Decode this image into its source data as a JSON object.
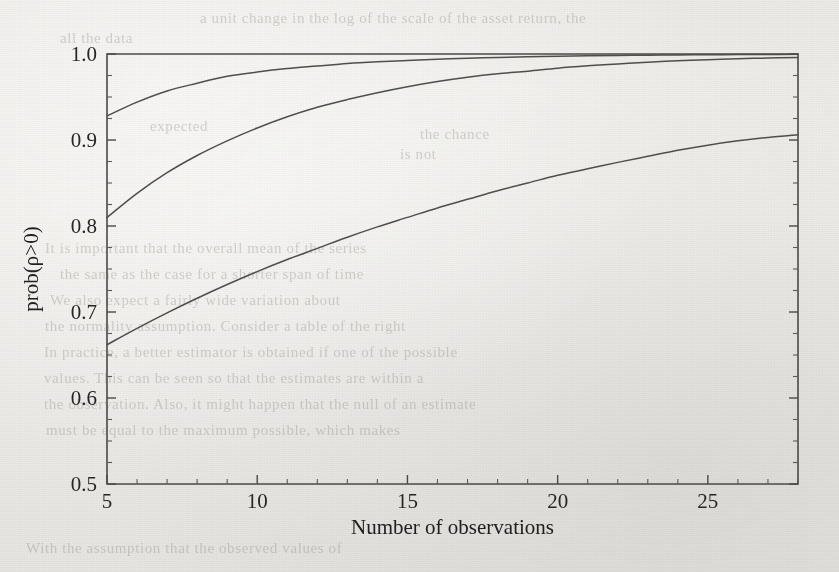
{
  "figure": {
    "background_color": "#efefec",
    "ink_color": "#4e4e4b"
  },
  "bleed_text": [
    {
      "text": "a unit change in the log of the scale of the asset return, the",
      "x": 200,
      "y": 10
    },
    {
      "text": "all the data",
      "x": 60,
      "y": 30
    },
    {
      "text": "expected",
      "x": 150,
      "y": 118
    },
    {
      "text": "the chance",
      "x": 420,
      "y": 126
    },
    {
      "text": "is not",
      "x": 400,
      "y": 146
    },
    {
      "text": "It is important that the overall mean of the series",
      "x": 45,
      "y": 240
    },
    {
      "text": "the same as the case for a shorter span of time",
      "x": 60,
      "y": 266
    },
    {
      "text": "We also expect a fairly wide variation about",
      "x": 50,
      "y": 292
    },
    {
      "text": "the normality assumption. Consider a table of the right",
      "x": 45,
      "y": 318
    },
    {
      "text": "In practice, a better estimator is obtained if one of the possible",
      "x": 44,
      "y": 344
    },
    {
      "text": "values. This can be seen so that the estimates are within a",
      "x": 44,
      "y": 370
    },
    {
      "text": "the observation. Also, it might happen that the null of an estimate",
      "x": 44,
      "y": 396
    },
    {
      "text": "must be equal to the maximum possible, which makes",
      "x": 46,
      "y": 422
    },
    {
      "text": "With the assumption that the observed values of",
      "x": 26,
      "y": 540
    }
  ],
  "chart_data": {
    "type": "line",
    "title": "",
    "xlabel": "Number of observations",
    "ylabel": "prob(ρ>0)",
    "xlim": [
      5,
      28
    ],
    "ylim": [
      0.5,
      1.0
    ],
    "xticks": [
      5,
      10,
      15,
      20,
      25
    ],
    "xticklabels": [
      "5",
      "10",
      "15",
      "20",
      "25"
    ],
    "yticks": [
      0.5,
      0.6,
      0.7,
      0.8,
      0.9,
      1.0
    ],
    "yticklabels": [
      "0.5",
      "0.6",
      "0.7",
      "0.8",
      "0.9",
      "1.0"
    ],
    "y_minor_step": 0.025,
    "x_minor_step": 1,
    "grid": false,
    "legend": "none",
    "series": [
      {
        "name": "upper-curve",
        "x": [
          5,
          6,
          7,
          8,
          9,
          10,
          11,
          12,
          13,
          14,
          15,
          16,
          17,
          18,
          19,
          20,
          21,
          22,
          23,
          24,
          25,
          26,
          27,
          28
        ],
        "y": [
          0.928,
          0.944,
          0.957,
          0.966,
          0.974,
          0.979,
          0.983,
          0.986,
          0.989,
          0.991,
          0.9925,
          0.994,
          0.9952,
          0.996,
          0.9968,
          0.9974,
          0.9979,
          0.9983,
          0.9986,
          0.9989,
          0.9991,
          0.9993,
          0.9995,
          0.9996
        ]
      },
      {
        "name": "middle-curve",
        "x": [
          5,
          6,
          7,
          8,
          9,
          10,
          11,
          12,
          13,
          14,
          15,
          16,
          17,
          18,
          19,
          20,
          21,
          22,
          23,
          24,
          25,
          26,
          27,
          28
        ],
        "y": [
          0.81,
          0.838,
          0.862,
          0.882,
          0.899,
          0.914,
          0.927,
          0.938,
          0.947,
          0.955,
          0.962,
          0.968,
          0.973,
          0.977,
          0.98,
          0.9835,
          0.9862,
          0.9885,
          0.9905,
          0.9921,
          0.9934,
          0.9945,
          0.9953,
          0.996
        ]
      },
      {
        "name": "lower-curve",
        "x": [
          5,
          6,
          7,
          8,
          9,
          10,
          11,
          12,
          13,
          14,
          15,
          16,
          17,
          18,
          19,
          20,
          21,
          22,
          23,
          24,
          25,
          26,
          27,
          28
        ],
        "y": [
          0.662,
          0.681,
          0.699,
          0.716,
          0.732,
          0.747,
          0.761,
          0.774,
          0.787,
          0.799,
          0.81,
          0.821,
          0.831,
          0.841,
          0.85,
          0.859,
          0.8665,
          0.874,
          0.881,
          0.888,
          0.894,
          0.899,
          0.903,
          0.906
        ]
      }
    ]
  }
}
